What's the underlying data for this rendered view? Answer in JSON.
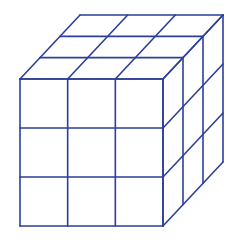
{
  "diagram": {
    "type": "isometric-cube-grid",
    "grid_size": 3,
    "stroke_color": "#2b3f9b",
    "background": "#ffffff",
    "front_face": {
      "x0": 20,
      "y0": 79,
      "x1": 163,
      "y1": 226
    },
    "depth_offset": {
      "dx": 60,
      "dy": -64
    }
  }
}
